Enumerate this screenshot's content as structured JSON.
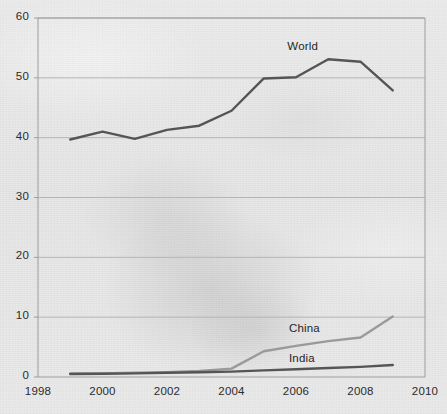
{
  "chart_data": {
    "type": "line",
    "title": "",
    "subtitle": "",
    "xlabel": "",
    "ylabel": "",
    "xlim": [
      1998,
      2010
    ],
    "ylim": [
      0,
      60
    ],
    "yticks": [
      0,
      10,
      20,
      30,
      40,
      50,
      60
    ],
    "ytick_labels": [
      "0",
      "10",
      "20",
      "30",
      "40",
      "50",
      "60"
    ],
    "xticks": [
      1998,
      2000,
      2002,
      2004,
      2006,
      2008,
      2010
    ],
    "xtick_labels": [
      "1998",
      "2000",
      "2002",
      "2004",
      "2006",
      "2008",
      "2010"
    ],
    "grid": "horizontal",
    "legend_position": "inline-annotations",
    "x": [
      1999,
      2000,
      2001,
      2002,
      2003,
      2004,
      2005,
      2006,
      2007,
      2008,
      2009
    ],
    "series": [
      {
        "name": "World",
        "color": "#555555",
        "values": [
          39.7,
          41.0,
          39.8,
          41.3,
          42.0,
          44.5,
          49.9,
          50.1,
          53.1,
          52.7,
          47.9
        ]
      },
      {
        "name": "China",
        "color": "#9a9a9a",
        "values": [
          0.6,
          0.6,
          0.7,
          0.8,
          1.0,
          1.4,
          4.3,
          5.2,
          6.0,
          6.6,
          10.1
        ]
      },
      {
        "name": "India",
        "color": "#555555",
        "values": [
          0.5,
          0.55,
          0.6,
          0.7,
          0.8,
          0.9,
          1.1,
          1.3,
          1.5,
          1.7,
          2.0
        ]
      }
    ],
    "annotations": [
      {
        "text": "World",
        "x": 2006.35,
        "y": 55.0
      },
      {
        "text": "China",
        "x": 2006.4,
        "y": 7.9
      },
      {
        "text": "India",
        "x": 2006.4,
        "y": 2.9
      }
    ],
    "axis_color": "#9d9d9d",
    "grid_color": "#b4b4b4",
    "plot_box": {
      "left": 38,
      "top": 18,
      "right": 425,
      "bottom": 377
    }
  }
}
